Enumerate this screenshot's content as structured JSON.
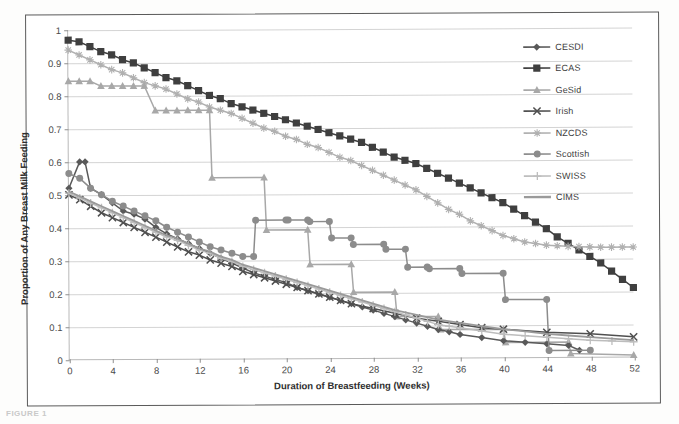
{
  "figure": {
    "caption": "FIGURE 1",
    "background": "#ffffff",
    "grid_color": "#d4d4d4",
    "axis_color": "#b9b9b9"
  },
  "legend": {
    "position": "right-inside",
    "entries": [
      {
        "label": "CESDI",
        "color": "#595959",
        "marker": "diamond"
      },
      {
        "label": "ECAS",
        "color": "#3f3f3f",
        "marker": "square"
      },
      {
        "label": "GeSid",
        "color": "#a8a8a8",
        "marker": "triangle"
      },
      {
        "label": "Irish",
        "color": "#4f4f4f",
        "marker": "cross"
      },
      {
        "label": "NZCDS",
        "color": "#b0b0b0",
        "marker": "star"
      },
      {
        "label": "Scottish",
        "color": "#8c8c8c",
        "marker": "circle"
      },
      {
        "label": "SWISS",
        "color": "#bdbdbd",
        "marker": "plus"
      },
      {
        "label": "CIMS",
        "color": "#9a9a9a",
        "marker": "none"
      }
    ]
  },
  "chart_data": {
    "type": "line",
    "title": "",
    "xlabel": "Duration of Breastfeeding (Weeks)",
    "ylabel": "Proportion of Any Breast Milk Feeding",
    "xlim": [
      0,
      52
    ],
    "ylim": [
      0,
      1
    ],
    "xticks": [
      0,
      4,
      8,
      12,
      16,
      20,
      24,
      28,
      32,
      36,
      40,
      44,
      48,
      52
    ],
    "yticks": [
      0,
      0.1,
      0.2,
      0.3,
      0.4,
      0.5,
      0.6,
      0.7,
      0.8,
      0.9,
      1
    ],
    "ytick_labels": [
      "0",
      "0.1",
      "0.2",
      "0.3",
      "0.4",
      "0.5",
      "0.6",
      "0.7",
      "0.8",
      "0.9",
      "1"
    ],
    "xtick_labels": [
      "0",
      "4",
      "8",
      "12",
      "16",
      "20",
      "24",
      "28",
      "32",
      "36",
      "40",
      "44",
      "48",
      "52"
    ],
    "grid": "horizontal",
    "legend_position": "right-inside",
    "series": [
      {
        "name": "ECAS",
        "color": "#3f3f3f",
        "marker": "square",
        "x": [
          0,
          1,
          2,
          3,
          4,
          5,
          6,
          7,
          8,
          9,
          10,
          11,
          12,
          13,
          14,
          15,
          16,
          17,
          18,
          19,
          20,
          21,
          22,
          23,
          24,
          25,
          26,
          27,
          28,
          29,
          30,
          31,
          32,
          33,
          34,
          35,
          36,
          37,
          38,
          39,
          40,
          41,
          42,
          43,
          44,
          45,
          46,
          47,
          48,
          49,
          50,
          51,
          52
        ],
        "y": [
          0.97,
          0.965,
          0.95,
          0.935,
          0.925,
          0.91,
          0.9,
          0.885,
          0.87,
          0.855,
          0.845,
          0.83,
          0.815,
          0.8,
          0.79,
          0.775,
          0.765,
          0.755,
          0.745,
          0.735,
          0.725,
          0.715,
          0.705,
          0.695,
          0.685,
          0.675,
          0.665,
          0.655,
          0.64,
          0.625,
          0.61,
          0.6,
          0.59,
          0.575,
          0.56,
          0.545,
          0.53,
          0.515,
          0.5,
          0.485,
          0.47,
          0.45,
          0.43,
          0.41,
          0.39,
          0.365,
          0.345,
          0.325,
          0.305,
          0.285,
          0.26,
          0.235,
          0.21
        ]
      },
      {
        "name": "NZCDS",
        "color": "#b0b0b0",
        "marker": "star",
        "x": [
          0,
          1,
          2,
          3,
          4,
          5,
          6,
          7,
          8,
          9,
          10,
          11,
          12,
          13,
          14,
          15,
          16,
          17,
          18,
          19,
          20,
          21,
          22,
          23,
          24,
          25,
          26,
          27,
          28,
          29,
          30,
          31,
          32,
          33,
          34,
          35,
          36,
          37,
          38,
          39,
          40,
          41,
          42,
          43,
          44,
          45,
          46,
          47,
          48,
          49,
          50,
          51,
          52
        ],
        "y": [
          0.94,
          0.925,
          0.91,
          0.895,
          0.88,
          0.87,
          0.855,
          0.84,
          0.83,
          0.82,
          0.805,
          0.79,
          0.78,
          0.765,
          0.755,
          0.745,
          0.73,
          0.715,
          0.7,
          0.69,
          0.675,
          0.665,
          0.65,
          0.64,
          0.625,
          0.61,
          0.6,
          0.585,
          0.57,
          0.555,
          0.54,
          0.525,
          0.51,
          0.49,
          0.47,
          0.45,
          0.435,
          0.415,
          0.4,
          0.385,
          0.37,
          0.36,
          0.35,
          0.345,
          0.34,
          0.338,
          0.336,
          0.335,
          0.334,
          0.333,
          0.333,
          0.333,
          0.333
        ]
      },
      {
        "name": "GeSid",
        "color": "#a8a8a8",
        "marker": "triangle",
        "x": [
          0,
          1,
          2,
          3,
          4,
          5,
          6,
          7,
          8,
          9,
          10,
          11,
          12,
          13,
          13.2,
          18,
          18.2,
          22,
          22.2,
          26,
          26.2,
          30,
          30.2,
          34,
          34.2,
          40,
          40.2,
          46,
          46.2,
          52
        ],
        "y": [
          0.845,
          0.845,
          0.845,
          0.83,
          0.83,
          0.83,
          0.83,
          0.83,
          0.755,
          0.755,
          0.755,
          0.755,
          0.755,
          0.755,
          0.55,
          0.55,
          0.39,
          0.39,
          0.285,
          0.285,
          0.2,
          0.2,
          0.125,
          0.125,
          0.085,
          0.085,
          0.045,
          0.045,
          0.01,
          0.005
        ]
      },
      {
        "name": "CESDI",
        "color": "#595959",
        "marker": "diamond",
        "x": [
          0,
          1,
          1.5,
          2,
          3,
          4,
          5,
          6,
          7,
          8,
          9,
          10,
          11,
          12,
          13,
          14,
          15,
          16,
          17,
          18,
          19,
          20,
          21,
          22,
          23,
          24,
          25,
          26,
          27,
          28,
          29,
          30,
          31,
          32,
          33,
          34,
          35,
          36,
          38,
          40,
          42,
          44,
          46,
          47
        ],
        "y": [
          0.52,
          0.6,
          0.6,
          0.52,
          0.5,
          0.475,
          0.45,
          0.44,
          0.425,
          0.4,
          0.38,
          0.365,
          0.35,
          0.335,
          0.32,
          0.305,
          0.29,
          0.275,
          0.26,
          0.25,
          0.24,
          0.23,
          0.215,
          0.205,
          0.195,
          0.185,
          0.175,
          0.165,
          0.155,
          0.145,
          0.135,
          0.125,
          0.115,
          0.105,
          0.095,
          0.085,
          0.078,
          0.07,
          0.06,
          0.05,
          0.045,
          0.04,
          0.035,
          0.02
        ]
      },
      {
        "name": "Scottish",
        "color": "#8c8c8c",
        "marker": "circle",
        "x": [
          0,
          1,
          2,
          3,
          4,
          5,
          6,
          7,
          8,
          9,
          10,
          11,
          12,
          13,
          14,
          15,
          16,
          17,
          17.2,
          20,
          20.2,
          22,
          22.2,
          24,
          24.2,
          26,
          26.2,
          29,
          29.2,
          31,
          31.2,
          33,
          33.2,
          36,
          36.2,
          40,
          40.2,
          44,
          44.2,
          48
        ],
        "y": [
          0.565,
          0.55,
          0.52,
          0.5,
          0.48,
          0.465,
          0.45,
          0.435,
          0.42,
          0.4,
          0.385,
          0.37,
          0.355,
          0.34,
          0.33,
          0.32,
          0.31,
          0.31,
          0.42,
          0.42,
          0.42,
          0.42,
          0.415,
          0.415,
          0.365,
          0.365,
          0.345,
          0.345,
          0.33,
          0.33,
          0.275,
          0.275,
          0.27,
          0.27,
          0.255,
          0.255,
          0.175,
          0.175,
          0.02,
          0.02
        ]
      },
      {
        "name": "Irish",
        "color": "#4f4f4f",
        "marker": "cross",
        "x": [
          0,
          1,
          2,
          3,
          4,
          5,
          6,
          7,
          8,
          9,
          10,
          11,
          12,
          13,
          14,
          15,
          16,
          17,
          18,
          19,
          20,
          21,
          22,
          23,
          24,
          25,
          26,
          28,
          30,
          32,
          34,
          36,
          38,
          40,
          44,
          48,
          52
        ],
        "y": [
          0.5,
          0.485,
          0.465,
          0.445,
          0.43,
          0.415,
          0.4,
          0.385,
          0.37,
          0.355,
          0.34,
          0.325,
          0.315,
          0.3,
          0.29,
          0.28,
          0.265,
          0.255,
          0.245,
          0.235,
          0.225,
          0.215,
          0.205,
          0.195,
          0.185,
          0.175,
          0.165,
          0.15,
          0.135,
          0.12,
          0.11,
          0.1,
          0.09,
          0.085,
          0.075,
          0.07,
          0.06
        ]
      },
      {
        "name": "SWISS",
        "color": "#bdbdbd",
        "marker": "plus",
        "x": [
          0,
          1,
          2,
          3,
          4,
          5,
          6,
          7,
          8,
          9,
          10,
          11,
          12,
          13,
          14,
          15,
          16,
          17,
          18,
          19,
          20,
          21,
          22,
          23,
          24,
          25,
          26,
          27,
          28,
          29,
          30,
          31,
          32,
          33,
          34,
          35,
          36,
          38,
          40,
          42,
          44,
          46,
          48,
          50,
          52
        ],
        "y": [
          0.505,
          0.49,
          0.475,
          0.46,
          0.445,
          0.43,
          0.415,
          0.4,
          0.385,
          0.37,
          0.36,
          0.345,
          0.33,
          0.32,
          0.305,
          0.295,
          0.28,
          0.27,
          0.26,
          0.25,
          0.24,
          0.23,
          0.22,
          0.21,
          0.2,
          0.19,
          0.18,
          0.17,
          0.16,
          0.15,
          0.14,
          0.13,
          0.12,
          0.11,
          0.1,
          0.095,
          0.09,
          0.08,
          0.07,
          0.065,
          0.06,
          0.055,
          0.05,
          0.048,
          0.045
        ]
      },
      {
        "name": "CIMS",
        "color": "#9a9a9a",
        "marker": "none",
        "x": [
          0,
          1,
          2,
          3,
          4,
          5,
          6,
          7,
          8,
          9,
          10,
          11,
          12,
          13,
          14,
          15,
          16,
          17,
          18,
          19,
          20,
          21,
          22,
          23,
          24,
          25,
          26,
          27,
          28,
          29,
          30,
          32,
          34,
          36,
          38,
          40,
          42,
          44,
          46,
          48,
          50,
          52
        ],
        "y": [
          0.51,
          0.495,
          0.48,
          0.465,
          0.45,
          0.435,
          0.42,
          0.405,
          0.39,
          0.375,
          0.365,
          0.35,
          0.335,
          0.325,
          0.31,
          0.3,
          0.285,
          0.275,
          0.265,
          0.255,
          0.245,
          0.235,
          0.225,
          0.215,
          0.205,
          0.195,
          0.185,
          0.175,
          0.165,
          0.155,
          0.145,
          0.13,
          0.115,
          0.105,
          0.095,
          0.085,
          0.078,
          0.07,
          0.065,
          0.06,
          0.055,
          0.05
        ]
      }
    ]
  }
}
